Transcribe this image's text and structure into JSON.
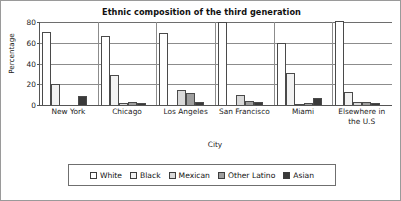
{
  "chart_data": {
    "type": "bar",
    "title": "Ethnic composition of the third generation",
    "xlabel": "City",
    "ylabel": "Percentage",
    "ylim": [
      0,
      80
    ],
    "yticks": [
      0,
      20,
      40,
      60,
      80
    ],
    "grid": true,
    "legend_position": "bottom",
    "categories": [
      "New York",
      "Chicago",
      "Los Angeles",
      "San Francisco",
      "Miami",
      "Elsewhere in the U.S"
    ],
    "series": [
      {
        "name": "White",
        "color": "#ffffff",
        "values": [
          70,
          67,
          69,
          80,
          60,
          81
        ]
      },
      {
        "name": "Black",
        "color": "#f2f2f2",
        "values": [
          20,
          29,
          0,
          0,
          31,
          13
        ]
      },
      {
        "name": "Mexican",
        "color": "#d9d9d9",
        "values": [
          0,
          2,
          14,
          10,
          1,
          3
        ]
      },
      {
        "name": "Other Latino",
        "color": "#9e9e9e",
        "values": [
          0,
          3,
          12,
          4,
          2,
          3
        ]
      },
      {
        "name": "Asian",
        "color": "#3a3a3a",
        "values": [
          9,
          2,
          3,
          3,
          7,
          2
        ]
      }
    ]
  },
  "legend": {
    "items": [
      {
        "label": "White"
      },
      {
        "label": "Black"
      },
      {
        "label": "Mexican"
      },
      {
        "label": "Other Latino"
      },
      {
        "label": "Asian"
      }
    ]
  },
  "axes": {
    "ytick_labels": [
      "0",
      "20",
      "40",
      "60",
      "80"
    ],
    "xtick_labels": [
      "New York",
      "Chicago",
      "Los Angeles",
      "San Francisco",
      "Miami",
      "Elsewhere in the U.S"
    ]
  }
}
